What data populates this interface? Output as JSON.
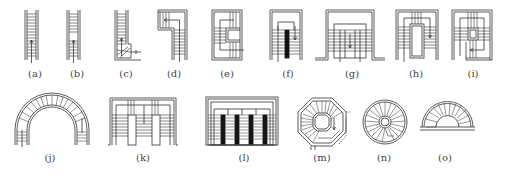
{
  "diagram": {
    "type": "stair-plan-types",
    "stroke_color": "#333333",
    "fill_dark": "#111111",
    "figures": [
      {
        "id": "a",
        "label": "(a)",
        "x": 35,
        "y": 70,
        "desc": "straight single-flight stair"
      },
      {
        "id": "b",
        "label": "(b)",
        "x": 77,
        "y": 70,
        "desc": "straight stair with intermediate landing"
      },
      {
        "id": "c",
        "label": "(c)",
        "x": 126,
        "y": 70,
        "desc": "straight stair with winder steps at base"
      },
      {
        "id": "d",
        "label": "(d)",
        "x": 174,
        "y": 70,
        "desc": "quarter-turn (L-shaped) stair"
      },
      {
        "id": "e",
        "label": "(e)",
        "x": 227,
        "y": 70,
        "desc": "three-flight U-shaped stair around wall"
      },
      {
        "id": "f",
        "label": "(f)",
        "x": 288,
        "y": 70,
        "desc": "double-flight parallel stair with central wall"
      },
      {
        "id": "g",
        "label": "(g)",
        "x": 352,
        "y": 70,
        "desc": "double-flight stair splitting into two"
      },
      {
        "id": "h",
        "label": "(h)",
        "x": 416,
        "y": 70,
        "desc": "three-flight stair around open well"
      },
      {
        "id": "i",
        "label": "(i)",
        "x": 473,
        "y": 70,
        "desc": "four-flight stair around small well"
      },
      {
        "id": "j",
        "label": "(j)",
        "x": 50,
        "y": 154,
        "desc": "curved arch stair"
      },
      {
        "id": "k",
        "label": "(k)",
        "x": 143,
        "y": 154,
        "desc": "twin double-flight stairs"
      },
      {
        "id": "l",
        "label": "(l)",
        "x": 244,
        "y": 154,
        "desc": "multiple parallel flights with walls"
      },
      {
        "id": "m",
        "label": "(m)",
        "x": 322,
        "y": 154,
        "desc": "octagonal spiral stair"
      },
      {
        "id": "n",
        "label": "(n)",
        "x": 384,
        "y": 154,
        "desc": "circular spiral stair"
      },
      {
        "id": "o",
        "label": "(o)",
        "x": 445,
        "y": 154,
        "desc": "semicircular curved stair"
      }
    ]
  }
}
